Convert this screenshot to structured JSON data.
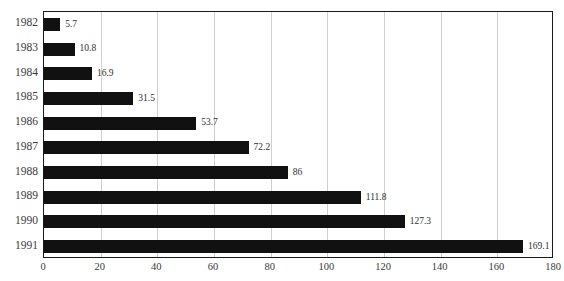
{
  "chart_data": {
    "type": "bar",
    "orientation": "horizontal",
    "title": "",
    "xlabel": "",
    "ylabel": "",
    "categories": [
      "1982",
      "1983",
      "1984",
      "1985",
      "1986",
      "1987",
      "1988",
      "1989",
      "1990",
      "1991"
    ],
    "values": [
      5.7,
      10.8,
      16.9,
      31.5,
      53.7,
      72.2,
      86,
      111.8,
      127.3,
      169.1
    ],
    "value_labels": [
      "5.7",
      "10.8",
      "16.9",
      "31.5",
      "53.7",
      "72.2",
      "86",
      "111.8",
      "127.3",
      "169.1"
    ],
    "xlim": [
      0,
      180
    ],
    "xticks": [
      0,
      20,
      40,
      60,
      80,
      100,
      120,
      140,
      160,
      180
    ],
    "xtick_labels": [
      "0",
      "20",
      "40",
      "60",
      "80",
      "100",
      "120",
      "140",
      "160",
      "180"
    ],
    "grid": true,
    "grid_axis": "x",
    "legend": null,
    "bar_color": "#111111",
    "grid_color": "#cfcfcf",
    "frame_color": "#1a1a1a",
    "background_color": "#ffffff"
  }
}
